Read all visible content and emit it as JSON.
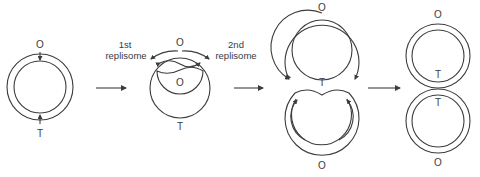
{
  "diagram": {
    "colors": {
      "stroke": "#3c3c3c",
      "text": "#3a3a3a",
      "background": "#ffffff"
    },
    "stages": [
      {
        "id": "stage-1",
        "description": "Circular chromosome before replication",
        "labels": {
          "origin": "O",
          "terminus": "T"
        }
      },
      {
        "id": "stage-2",
        "description": "Replication initiated at origin, two replisomes moving in opposite directions",
        "labels": {
          "origin_outer": "O",
          "origin_inner": "O",
          "terminus": "T",
          "replisome_1_line1": "1st",
          "replisome_1_line2": "replisome",
          "replisome_2_line1": "2nd",
          "replisome_2_line2": "replisome"
        }
      },
      {
        "id": "stage-3",
        "description": "Replication nearly complete, forks approaching terminus",
        "labels": {
          "origin_top": "O",
          "terminus": "T",
          "origin_bottom": "O"
        }
      },
      {
        "id": "stage-4",
        "description": "Two daughter chromosomes joined at terminus",
        "labels": {
          "origin_top": "O",
          "terminus_top": "T",
          "terminus_bottom": "T",
          "origin_bottom": "O"
        }
      }
    ],
    "transitions": [
      "arrow-1",
      "arrow-2",
      "arrow-3"
    ]
  }
}
